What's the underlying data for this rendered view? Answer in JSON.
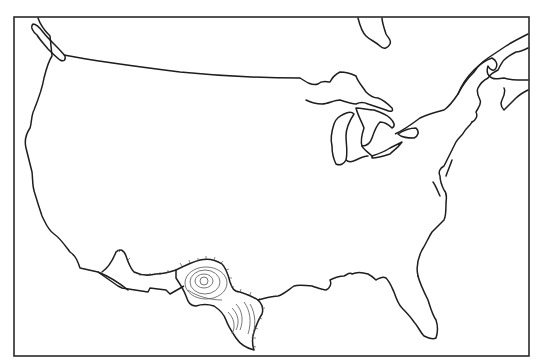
{
  "map": {
    "subject": "Outline map of the contiguous United States with Great Lakes and neighboring coastlines",
    "frame": {
      "stroke": "#2a2a2a",
      "fill": "#ffffff"
    },
    "line_color": "#1e1e1e",
    "highlighted_region": {
      "name": "Texas",
      "style": "contour lines with hachure ticks",
      "contour_color": "#555555"
    },
    "features": [
      "Pacific coast",
      "Vancouver Island",
      "Canada border",
      "Hudson Bay (James Bay)",
      "Great Lakes",
      "Gulf of St. Lawrence",
      "Atlantic coast",
      "Florida",
      "Gulf of Mexico coast",
      "Mexico border"
    ]
  }
}
